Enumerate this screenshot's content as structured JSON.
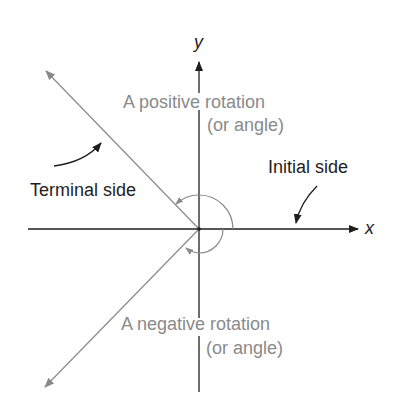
{
  "diagram": {
    "axes": {
      "x_label": "x",
      "y_label": "y"
    },
    "labels": {
      "positive_line1": "A positive rotation",
      "positive_line2": "(or angle)",
      "negative_line1": "A negative rotation",
      "negative_line2": "(or angle)",
      "terminal_side": "Terminal side",
      "initial_side": "Initial side"
    },
    "colors": {
      "axis": "#1e1e1e",
      "ray": "#8a8a8a",
      "arc": "#8a8a8a",
      "text_dark": "#1e1e1e",
      "text_gray": "#8a8a8a"
    }
  }
}
